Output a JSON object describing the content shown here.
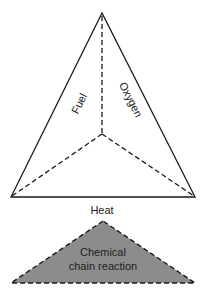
{
  "diagram": {
    "type": "fire-tetrahedron",
    "colors": {
      "stroke": "#1a1a1a",
      "face_fill": "#ffffff",
      "base_fill": "#8c8c8c",
      "text": "#222222"
    },
    "tetrahedron": {
      "faces": [
        {
          "id": "fuel",
          "label": "Fuel"
        },
        {
          "id": "oxygen",
          "label": "Oxygen"
        },
        {
          "id": "heat",
          "label": "Heat"
        }
      ]
    },
    "base_triangle": {
      "label_line1": "Chemical",
      "label_line2": "chain reaction"
    }
  }
}
